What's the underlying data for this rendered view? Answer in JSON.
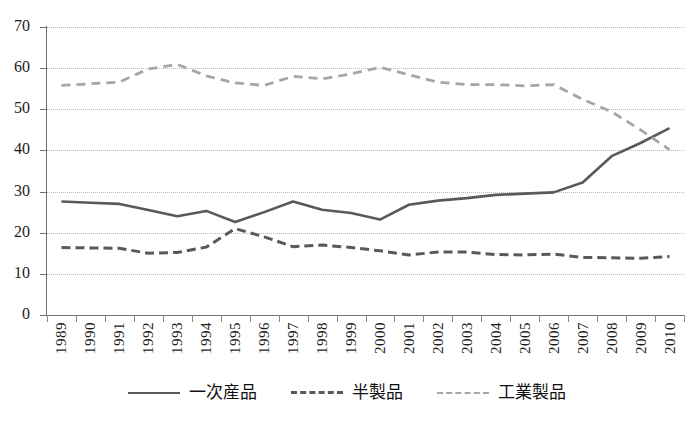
{
  "chart_data": {
    "type": "line",
    "title": "",
    "xlabel": "",
    "ylabel": "",
    "ylim": [
      0,
      70
    ],
    "ytick_step": 10,
    "yticks": [
      70,
      60,
      50,
      40,
      30,
      20,
      10,
      0
    ],
    "grid": true,
    "legend_position": "bottom",
    "categories": [
      "1989",
      "1990",
      "1991",
      "1992",
      "1993",
      "1994",
      "1995",
      "1996",
      "1997",
      "1998",
      "1999",
      "2000",
      "2001",
      "2002",
      "2003",
      "2004",
      "2005",
      "2006",
      "2007",
      "2008",
      "2009",
      "2010"
    ],
    "series": [
      {
        "name": "一次産品",
        "style": "solid",
        "color": "#595959",
        "values": [
          27.6,
          27.3,
          27.0,
          25.5,
          24.0,
          25.3,
          22.6,
          25.0,
          27.6,
          25.6,
          24.8,
          23.2,
          26.8,
          27.8,
          28.4,
          29.2,
          29.5,
          29.8,
          32.2,
          38.6,
          41.8,
          45.4
        ]
      },
      {
        "name": "半製品",
        "style": "dashed",
        "color": "#595959",
        "values": [
          16.4,
          16.3,
          16.2,
          15.0,
          15.2,
          16.5,
          21.0,
          19.0,
          16.6,
          17.0,
          16.4,
          15.6,
          14.6,
          15.3,
          15.3,
          14.7,
          14.6,
          14.8,
          14.0,
          13.9,
          13.8,
          14.2
        ]
      },
      {
        "name": "工業製品",
        "style": "dashed-light",
        "color": "#a6a6a6",
        "values": [
          55.8,
          56.2,
          56.6,
          59.8,
          60.9,
          58.1,
          56.4,
          55.8,
          58.0,
          57.4,
          58.6,
          60.2,
          58.4,
          56.6,
          56.0,
          56.0,
          55.7,
          56.0,
          52.4,
          49.4,
          45.0,
          40.2
        ]
      }
    ]
  },
  "legend": {
    "items": [
      {
        "label": "一次産品"
      },
      {
        "label": "半製品"
      },
      {
        "label": "工業製品"
      }
    ]
  }
}
